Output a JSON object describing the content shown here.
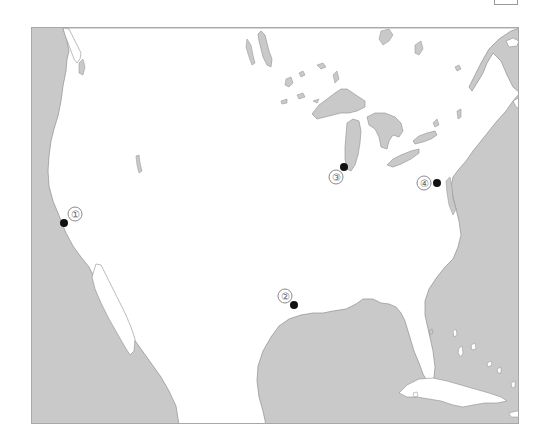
{
  "map": {
    "region": "United States and surroundings",
    "colors": {
      "land": "#ffffff",
      "water": "#c9c9c9",
      "coastline": "#8f8f8f",
      "marker": "#111111",
      "label_text": "#666666"
    },
    "markers": [
      {
        "id": 1,
        "label": "①",
        "x": 64,
        "y": 223,
        "label_x": 75,
        "label_y": 214,
        "location_hint": "California coast (San Francisco area)"
      },
      {
        "id": 2,
        "label": "②",
        "x": 294,
        "y": 305,
        "label_x": 285,
        "label_y": 296,
        "location_hint": "Gulf of Mexico coast (Houston area)"
      },
      {
        "id": 3,
        "label": "③",
        "x": 344,
        "y": 167,
        "label_x": 336,
        "label_y": 177,
        "location_hint": "Southern tip of Lake Michigan (Chicago)"
      },
      {
        "id": 4,
        "label": "④",
        "x": 437,
        "y": 183,
        "label_x": 424,
        "label_y": 183,
        "location_hint": "Mid-Atlantic coast (Washington D.C. area)"
      }
    ]
  }
}
